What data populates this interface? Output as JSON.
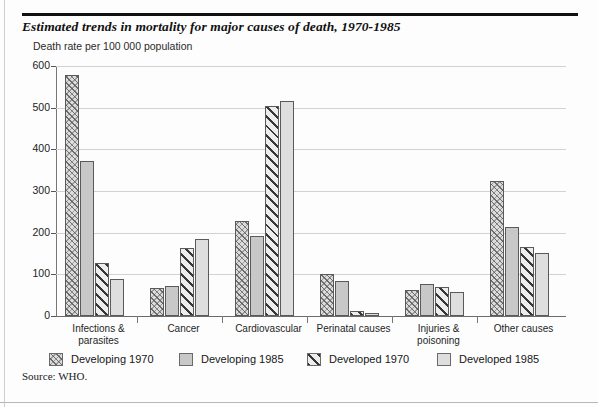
{
  "figure": {
    "title": "Estimated trends in mortality for major causes of death, 1970-1985",
    "axis_caption": "Death rate per 100 000 population",
    "source": "Source: WHO."
  },
  "chart_data": {
    "type": "bar",
    "title": "Estimated trends in mortality for major causes of death, 1970-1985",
    "subtitle": "Death rate per 100 000 population",
    "xlabel": "",
    "ylabel": "Death rate per 100 000 population",
    "ylim": [
      0,
      600
    ],
    "yticks": [
      0,
      100,
      200,
      300,
      400,
      500,
      600
    ],
    "grid": true,
    "legend_position": "bottom",
    "source": "Source: WHO.",
    "categories": [
      "Infections & parasites",
      "Cancer",
      "Cardiovascular",
      "Perinatal causes",
      "Injuries & poisoning",
      "Other causes"
    ],
    "category_lines": [
      [
        "Infections &",
        "parasites"
      ],
      [
        "Cancer",
        ""
      ],
      [
        "Cardiovascular",
        ""
      ],
      [
        "Perinatal causes",
        ""
      ],
      [
        "Injuries &",
        "poisoning"
      ],
      [
        "Other causes",
        ""
      ]
    ],
    "series": [
      {
        "name": "Developing 1970",
        "pattern": "crosshatch",
        "color": "#dcdcdc",
        "values": [
          578,
          68,
          227,
          100,
          62,
          323
        ]
      },
      {
        "name": "Developing 1985",
        "pattern": "solid-mid-gray",
        "color": "#c8c8c8",
        "values": [
          373,
          72,
          193,
          85,
          77,
          213
        ]
      },
      {
        "name": "Developed 1970",
        "pattern": "diagonal-hatch",
        "color": "#ededed",
        "values": [
          128,
          163,
          503,
          13,
          70,
          165
        ]
      },
      {
        "name": "Developed 1985",
        "pattern": "solid-light-gray",
        "color": "#dedede",
        "values": [
          90,
          185,
          515,
          8,
          58,
          152
        ]
      }
    ]
  },
  "legend": {
    "items": [
      {
        "label": "Developing 1970"
      },
      {
        "label": "Developing 1985"
      },
      {
        "label": "Developed 1970"
      },
      {
        "label": "Developed 1985"
      }
    ]
  }
}
